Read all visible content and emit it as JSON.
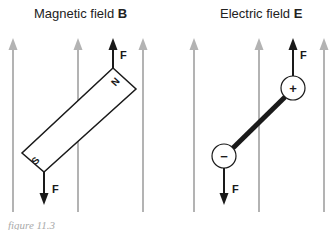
{
  "panels": {
    "left": {
      "title_prefix": "Magnetic field ",
      "title_symbol": "B",
      "pole_north": "N",
      "pole_south": "S",
      "force_top_label": "F",
      "force_bottom_label": "F"
    },
    "right": {
      "title_prefix": "Electric field ",
      "title_symbol": "E",
      "charge_positive": "+",
      "charge_negative": "−",
      "force_top_label": "F",
      "force_bottom_label": "F"
    }
  },
  "caption": "figure 11.3",
  "colors": {
    "field_line": "#b3b3b3",
    "ink": "#1a1a1a"
  }
}
